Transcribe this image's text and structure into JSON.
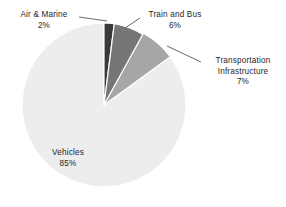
{
  "chart_data": {
    "type": "pie",
    "title": "",
    "subtitle": "",
    "xlabel": "",
    "ylabel": "",
    "legend_position": "none",
    "grid": false,
    "units": "percent",
    "total": 100,
    "start_angle_deg": 0,
    "direction": "clockwise",
    "categories": [
      "Air & Marine",
      "Train and Bus",
      "Transportation Infrastructure",
      "Vehicles"
    ],
    "values": [
      2,
      6,
      7,
      85
    ],
    "slices": [
      {
        "label": "Air & Marine",
        "value": 2,
        "value_text": "2%",
        "color": "#3a3a3a",
        "label_placement": "outside-left",
        "leader": true
      },
      {
        "label": "Train and Bus",
        "value": 6,
        "value_text": "6%",
        "color": "#767676",
        "label_placement": "outside-top-right",
        "leader": true
      },
      {
        "label": "Transportation Infrastructure",
        "label_line1": "Transportation",
        "label_line2": "Infrastructure",
        "value": 7,
        "value_text": "7%",
        "color": "#a6a6a6",
        "label_placement": "outside-right",
        "leader": true
      },
      {
        "label": "Vehicles",
        "value": 85,
        "value_text": "85%",
        "color": "#ededed",
        "label_placement": "inside",
        "leader": false
      }
    ]
  },
  "labels": {
    "air_marine": {
      "name": "Air & Marine",
      "percent": "2%"
    },
    "train_bus": {
      "name": "Train and Bus",
      "percent": "6%"
    },
    "transport_infra": {
      "name_line1": "Transportation",
      "name_line2": "Infrastructure",
      "percent": "7%"
    },
    "vehicles": {
      "name": "Vehicles",
      "percent": "85%"
    }
  },
  "style": {
    "background": "#ffffff",
    "slice_border": "#ffffff",
    "leader_line": "#595959",
    "text_color": "#262626"
  }
}
